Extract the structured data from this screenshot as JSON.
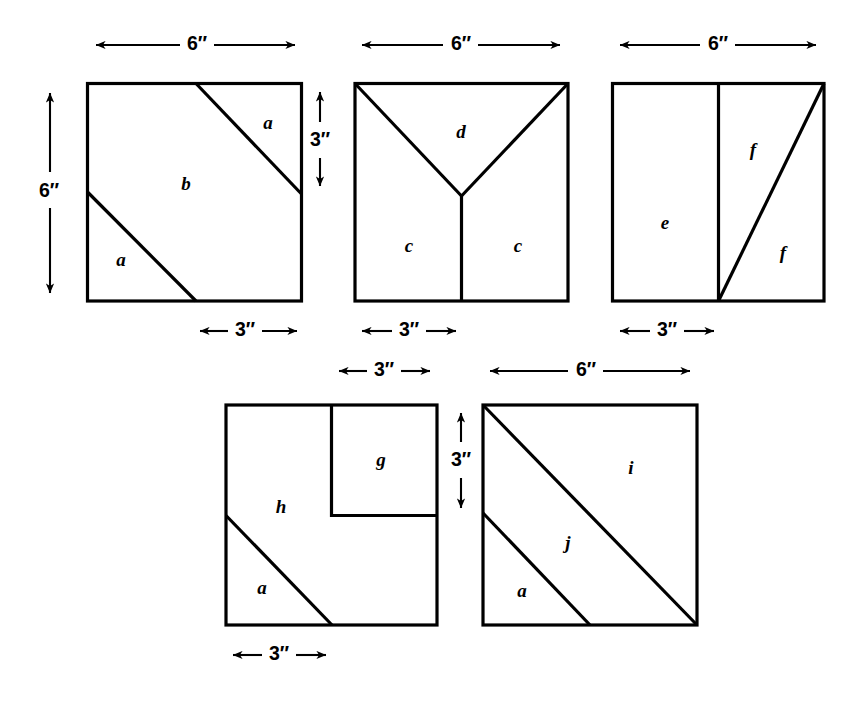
{
  "figure": {
    "units_symbol": "″",
    "stroke_color": "#000000",
    "background_color": "#ffffff",
    "squares": [
      {
        "id": "square-1",
        "piece_labels": [
          "a",
          "b",
          "a"
        ],
        "dimensions": [
          {
            "name": "top",
            "value": "6″",
            "orientation": "horizontal"
          },
          {
            "name": "left",
            "value": "6″",
            "orientation": "vertical"
          },
          {
            "name": "right",
            "value": "3″",
            "orientation": "vertical"
          },
          {
            "name": "bottom",
            "value": "3″",
            "orientation": "horizontal"
          }
        ]
      },
      {
        "id": "square-2",
        "piece_labels": [
          "d",
          "c",
          "c"
        ],
        "dimensions": [
          {
            "name": "top",
            "value": "6″",
            "orientation": "horizontal"
          },
          {
            "name": "bottom",
            "value": "3″",
            "orientation": "horizontal"
          }
        ]
      },
      {
        "id": "square-3",
        "piece_labels": [
          "e",
          "f",
          "f"
        ],
        "dimensions": [
          {
            "name": "top",
            "value": "6″",
            "orientation": "horizontal"
          },
          {
            "name": "bottom",
            "value": "3″",
            "orientation": "horizontal"
          }
        ]
      },
      {
        "id": "square-4",
        "piece_labels": [
          "g",
          "h",
          "a"
        ],
        "dimensions": [
          {
            "name": "top",
            "value": "3″",
            "orientation": "horizontal"
          },
          {
            "name": "right",
            "value": "3″",
            "orientation": "vertical"
          },
          {
            "name": "bottom",
            "value": "3″",
            "orientation": "horizontal"
          }
        ]
      },
      {
        "id": "square-5",
        "piece_labels": [
          "i",
          "j",
          "a"
        ],
        "dimensions": [
          {
            "name": "top",
            "value": "6″",
            "orientation": "horizontal"
          }
        ]
      }
    ],
    "labels": {
      "sq1_a_top": "a",
      "sq1_b": "b",
      "sq1_a_bottom": "a",
      "sq2_d": "d",
      "sq2_c_left": "c",
      "sq2_c_right": "c",
      "sq3_e": "e",
      "sq3_f_top": "f",
      "sq3_f_bottom": "f",
      "sq4_g": "g",
      "sq4_h": "h",
      "sq4_a": "a",
      "sq5_i": "i",
      "sq5_j": "j",
      "sq5_a": "a"
    },
    "dimension_text": {
      "sq1_top": "6″",
      "sq1_left": "6″",
      "sq1_right": "3″",
      "sq1_bottom": "3″",
      "sq2_top": "6″",
      "sq2_bottom": "3″",
      "sq3_top": "6″",
      "sq3_bottom": "3″",
      "sq4_top": "3″",
      "sq4_right": "3″",
      "sq4_bottom": "3″",
      "sq5_top": "6″"
    }
  }
}
